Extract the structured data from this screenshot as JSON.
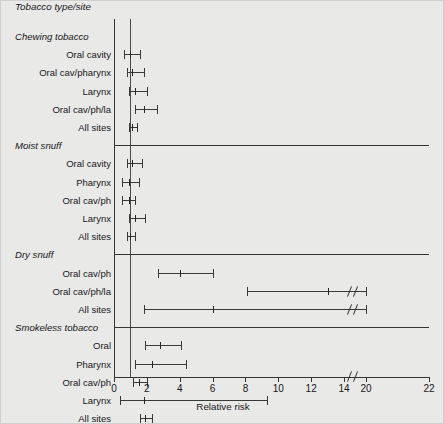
{
  "figure": {
    "column_header": "Tobacco type/site",
    "xlabel": "Relative risk",
    "background_color": "#e9e9e7",
    "line_color": "#35352f",
    "reference_line_value": 1
  },
  "chart_data": {
    "type": "scatter",
    "title": "Tobacco type/site",
    "xlabel": "Relative risk",
    "ylabel": "",
    "xlim": [
      0,
      22
    ],
    "grid": false,
    "legend": "none",
    "axis_break": {
      "from": 14,
      "to": 20,
      "note": "axis break drawn between 14 and 20"
    },
    "reference_line": 1,
    "tick_labels": [
      "0",
      "2",
      "4",
      "6",
      "8",
      "10",
      "12",
      "14",
      "20",
      "22"
    ],
    "tick_values": [
      0,
      2,
      4,
      6,
      8,
      10,
      12,
      14,
      20,
      22
    ],
    "groups": [
      {
        "name": "Chewing tobacco",
        "rows": [
          {
            "label": "Oral cavity",
            "estimate": 1.0,
            "low": 0.6,
            "high": 1.6
          },
          {
            "label": "Oral cav/pharynx",
            "estimate": 1.1,
            "low": 0.8,
            "high": 1.8
          },
          {
            "label": "Larynx",
            "estimate": 1.3,
            "low": 0.9,
            "high": 2.0
          },
          {
            "label": "Oral cav/ph/la",
            "estimate": 1.8,
            "low": 1.3,
            "high": 2.6
          },
          {
            "label": "All sites",
            "estimate": 1.1,
            "low": 0.9,
            "high": 1.4
          }
        ]
      },
      {
        "name": "Moist snuff",
        "rows": [
          {
            "label": "Oral cavity",
            "estimate": 1.1,
            "low": 0.8,
            "high": 1.7
          },
          {
            "label": "Pharynx",
            "estimate": 0.9,
            "low": 0.5,
            "high": 1.5
          },
          {
            "label": "Oral cav/ph",
            "estimate": 0.9,
            "low": 0.5,
            "high": 1.3
          },
          {
            "label": "Larynx",
            "estimate": 1.3,
            "low": 0.9,
            "high": 1.9
          },
          {
            "label": "All sites",
            "estimate": 1.0,
            "low": 0.8,
            "high": 1.3
          }
        ]
      },
      {
        "name": "Dry snuff",
        "rows": [
          {
            "label": "Oral cav/ph",
            "estimate": 4.0,
            "low": 2.7,
            "high": 6.0
          },
          {
            "label": "Oral cav/ph/la",
            "estimate": 13.0,
            "low": 8.1,
            "high": 20.0,
            "high_truncated": true
          },
          {
            "label": "All sites",
            "estimate": 6.0,
            "low": 1.8,
            "high": 20.0,
            "high_truncated": true
          }
        ]
      },
      {
        "name": "Smokeless tobacco",
        "rows": [
          {
            "label": "Oral",
            "estimate": 2.8,
            "low": 1.9,
            "high": 4.1
          },
          {
            "label": "Pharynx",
            "estimate": 2.3,
            "low": 1.25,
            "high": 4.4
          },
          {
            "label": "Oral cav/ph",
            "estimate": 1.5,
            "low": 1.15,
            "high": 2.0
          },
          {
            "label": "Larynx",
            "estimate": 1.8,
            "low": 0.35,
            "high": 9.3
          },
          {
            "label": "All sites",
            "estimate": 1.9,
            "low": 1.6,
            "high": 2.3
          }
        ]
      }
    ]
  }
}
